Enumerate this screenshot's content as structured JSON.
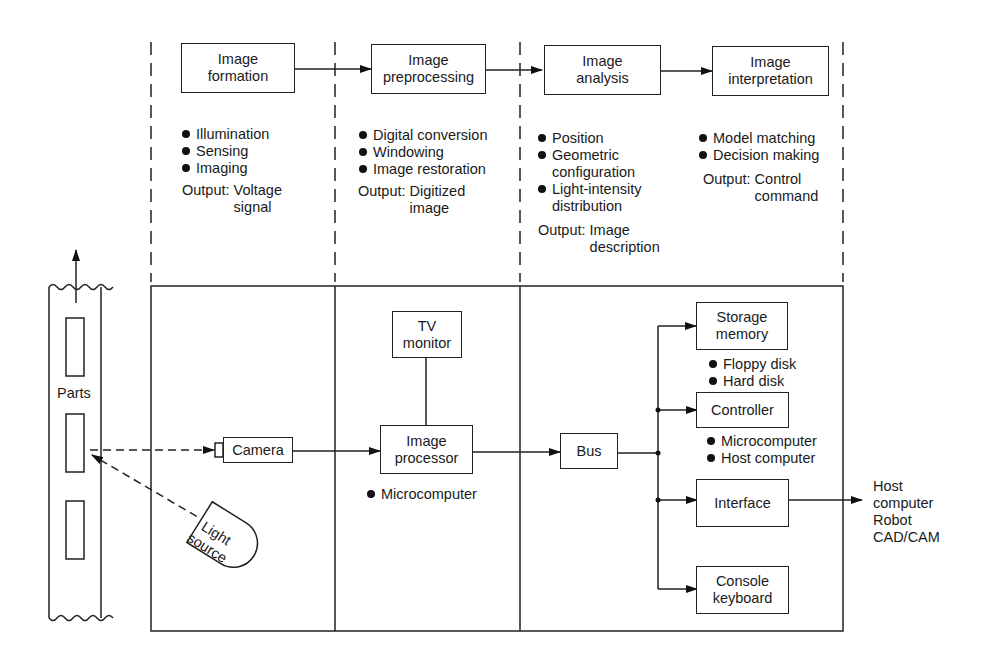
{
  "stages": [
    {
      "title_line1": "Image",
      "title_line2": "formation",
      "bullets": [
        "Illumination",
        "Sensing",
        "Imaging"
      ],
      "output_label": "Output:",
      "output_line1": "Voltage",
      "output_line2": "signal"
    },
    {
      "title_line1": "Image",
      "title_line2": "preprocessing",
      "bullets": [
        "Digital conversion",
        "Windowing",
        "Image restoration"
      ],
      "output_label": "Output:",
      "output_line1": "Digitized",
      "output_line2": "image"
    },
    {
      "title_line1": "Image",
      "title_line2": "analysis",
      "bullets": [
        "Position",
        "Geometric\nconfiguration",
        "Light-intensity\ndistribution"
      ],
      "output_label": "Output:",
      "output_line1": "Image",
      "output_line2": "description"
    },
    {
      "title_line1": "Image",
      "title_line2": "interpretation",
      "bullets": [
        "Model matching",
        "Decision making"
      ],
      "output_label": "Output:",
      "output_line1": "Control",
      "output_line2": "command"
    }
  ],
  "hardware": {
    "parts_label": "Parts",
    "camera": "Camera",
    "light_source_line1": "Light",
    "light_source_line2": "source",
    "tv_monitor_line1": "TV",
    "tv_monitor_line2": "monitor",
    "image_processor_line1": "Image",
    "image_processor_line2": "processor",
    "image_processor_bullets": [
      "Microcomputer"
    ],
    "bus": "Bus",
    "storage_line1": "Storage",
    "storage_line2": "memory",
    "storage_bullets": [
      "Floppy disk",
      "Hard disk"
    ],
    "controller": "Controller",
    "controller_bullets": [
      "Microcomputer",
      "Host computer"
    ],
    "interface": "Interface",
    "console_line1": "Console",
    "console_line2": "keyboard",
    "external_targets": [
      "Host",
      "computer",
      "Robot",
      "CAD/CAM"
    ]
  }
}
